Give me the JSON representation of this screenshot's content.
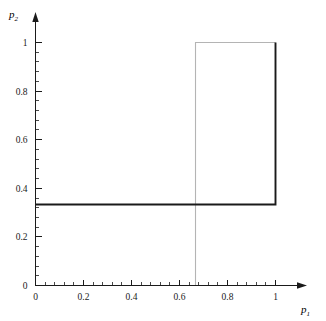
{
  "chart_data": {
    "type": "line",
    "title": "",
    "xlabel": "p_1",
    "ylabel": "p_2",
    "xlabel_base": "p",
    "xlabel_sub": "1",
    "ylabel_base": "p",
    "ylabel_sub": "2",
    "xlim": [
      0,
      1.08
    ],
    "ylim": [
      0,
      1.1
    ],
    "grid": false,
    "legend": null,
    "x_major_ticks": [
      0,
      0.2,
      0.4,
      0.6,
      0.8,
      1
    ],
    "x_major_tick_labels": [
      "0",
      "0.2",
      "0.4",
      "0.6",
      "0.8",
      "1"
    ],
    "y_major_ticks": [
      0,
      0.2,
      0.4,
      0.6,
      0.8,
      1
    ],
    "y_major_tick_labels": [
      "0",
      "0.2",
      "0.4",
      "0.6",
      "0.8",
      "1"
    ],
    "minor_tick_step": 0.04,
    "series": [
      {
        "name": "best-response-2",
        "color": "#1a1a1a",
        "width": 1.9,
        "points": [
          [
            0,
            0.3333
          ],
          [
            1,
            0.3333
          ],
          [
            1,
            1.0
          ]
        ]
      },
      {
        "name": "best-response-1",
        "color": "#b4b4b4",
        "width": 1.1,
        "points": [
          [
            0.6667,
            0.0
          ],
          [
            0.6667,
            1.0
          ],
          [
            1.0,
            1.0
          ]
        ]
      }
    ],
    "annotations": [
      {
        "name": "equilibrium-mixed",
        "x": 0.6667,
        "y": 0.3333
      },
      {
        "name": "equilibrium-corner",
        "x": 1.0,
        "y": 1.0
      }
    ]
  },
  "axes": {
    "x_arrow": true,
    "y_arrow": true,
    "axis_color": "#1a1a1a"
  }
}
